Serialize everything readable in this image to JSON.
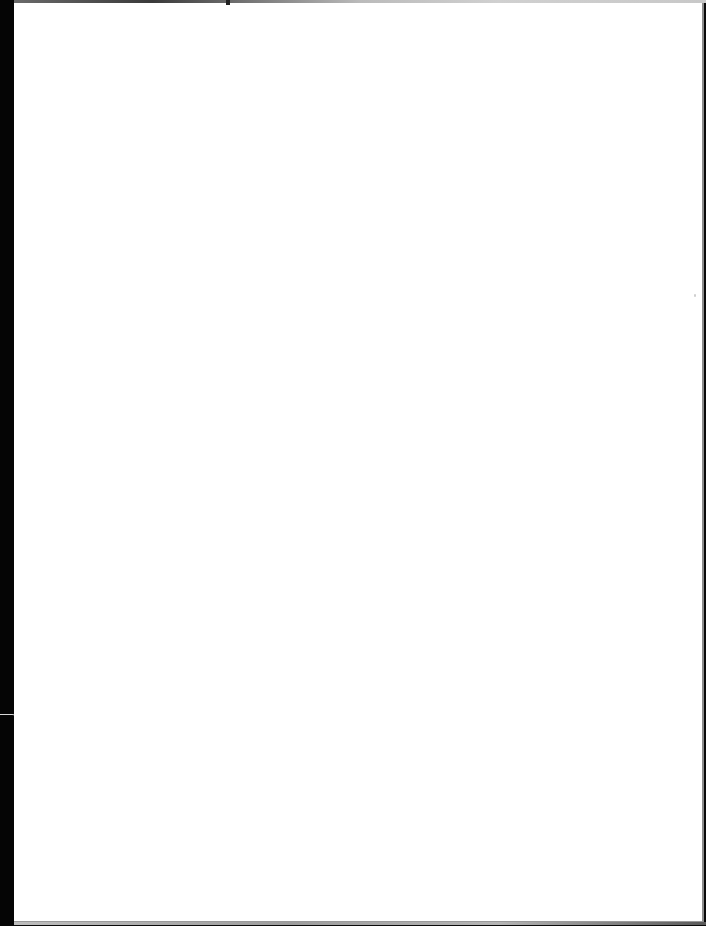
{
  "document": {
    "type": "scanned-page",
    "content": "",
    "is_blank": true
  },
  "colors": {
    "paper": "#ffffff",
    "scanner_edge": "#050505",
    "edge_shadow": "#8c8c8c"
  }
}
